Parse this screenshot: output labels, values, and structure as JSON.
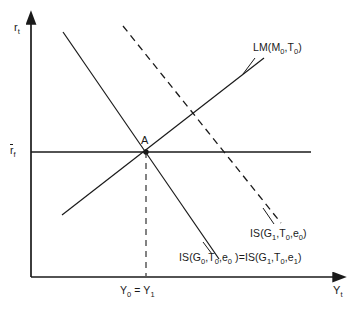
{
  "figure": {
    "type": "economics-diagram",
    "model": "IS-LM"
  },
  "axes": {
    "y_axis_label": "r",
    "y_axis_label_sub": "t",
    "x_axis_label": "Y",
    "x_axis_label_sub": "t"
  },
  "ticks": {
    "y": [
      {
        "label": "r",
        "sub": "f",
        "overbar": true,
        "value": "r̄_f"
      }
    ],
    "x": [
      {
        "label_a": "Y",
        "sub_a": "0",
        "eq": " = ",
        "label_b": "Y",
        "sub_b": "1",
        "value": "Y0 = Y1"
      }
    ]
  },
  "annotations": {
    "equilibrium_point": "A"
  },
  "curves": {
    "lm": {
      "name": "LM",
      "args_open": "(M",
      "arg1_sub": "0",
      "sep1": ",T",
      "arg2_sub": "0",
      "args_close": ")",
      "full": "LM(M0,T0)",
      "style": "solid",
      "slope": "upward"
    },
    "is_dashed": {
      "name": "IS",
      "args_open": "(G",
      "arg1_sub": "1",
      "sep1": ",T",
      "arg2_sub": "0",
      "sep2": ",e",
      "arg3_sub": "0",
      "args_close": ")",
      "full": "IS(G1,T0,e0)",
      "style": "dashed",
      "slope": "downward"
    },
    "is_solid": {
      "name_a": "IS",
      "args_open_a": "(G",
      "arg1_sub_a": "0",
      "sep1_a": ",T",
      "arg2_sub_a": "0",
      "sep2_a": ",e",
      "arg3_sub_a": "0",
      "args_close_a": " )",
      "equals": "=",
      "name_b": "IS",
      "args_open_b": "(G",
      "arg1_sub_b": "1",
      "sep1_b": ",T",
      "arg2_sub_b": "0",
      "sep2_b": ",e",
      "arg3_sub_b": "1",
      "args_close_b": ")",
      "full": "IS(G0,T0,e0 )=IS(G1,T0,e1)",
      "style": "solid",
      "slope": "downward"
    }
  },
  "colors": {
    "line": "#1a1a1a",
    "background": "#ffffff"
  }
}
